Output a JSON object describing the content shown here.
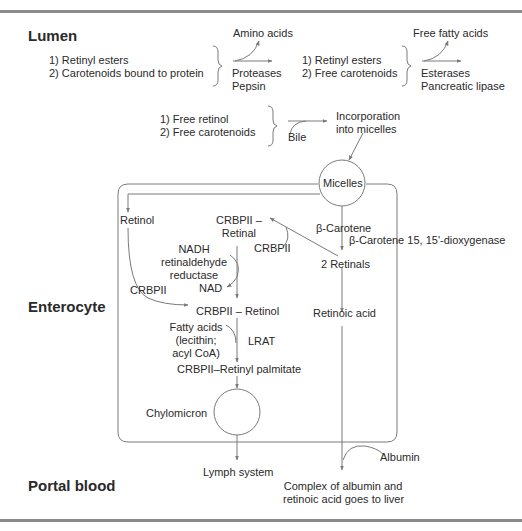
{
  "regions": {
    "lumen": "Lumen",
    "enterocyte": "Enterocyte",
    "portal_blood": "Portal blood"
  },
  "lumen": {
    "group1": {
      "items": [
        "1) Retinyl esters",
        "2) Carotenoids bound to protein"
      ],
      "product": "Amino acids",
      "enzymes": [
        "Proteases",
        "Pepsin"
      ]
    },
    "group2": {
      "items": [
        "1) Retinyl esters",
        "2) Free carotenoids"
      ],
      "product": "Free fatty acids",
      "enzymes": [
        "Esterases",
        "Pancreatic lipase"
      ]
    },
    "group3": {
      "items": [
        "1) Free retinol",
        "2) Free carotenoids"
      ],
      "cofactor": "Bile",
      "result": [
        "Incorporation",
        "into micelles"
      ]
    }
  },
  "enterocyte": {
    "micelles": "Micelles",
    "retinol": "Retinol",
    "crbpii_left": "CRBPII",
    "crbpii_retinal": [
      "CRBPII –",
      "Retinal"
    ],
    "nadh_enzyme": [
      "NADH",
      "retinaldehyde",
      "reductase"
    ],
    "nad": "NAD",
    "crbpii_mid": "CRBPII",
    "beta_carotene": "β-Carotene",
    "dioxygenase": "β-Carotene 15, 15'-dioxygenase",
    "two_retinals": "2 Retinals",
    "crbpii_retinol": "CRBPII – Retinol",
    "retinoic_acid": "Retinoic acid",
    "fatty_acids": [
      "Fatty acids",
      "(lecithin;",
      "acyl CoA)"
    ],
    "lrat": "LRAT",
    "crbpii_palmitate": "CRBPII–Retinyl palmitate",
    "chylomicron": "Chylomicron"
  },
  "portal": {
    "lymph": "Lymph system",
    "albumin": "Albumin",
    "complex": [
      "Complex of albumin and",
      "retinoic acid goes to liver"
    ]
  },
  "colors": {
    "line": "#7a7a7a",
    "text": "#2a2a2a",
    "rule": "#8a8a8a"
  }
}
